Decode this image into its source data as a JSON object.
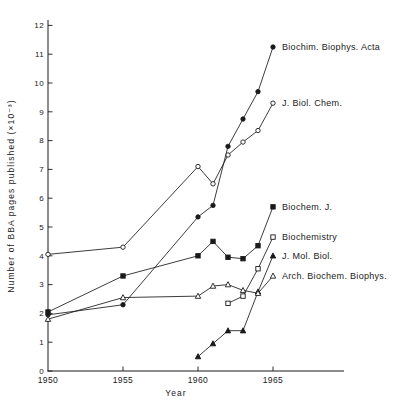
{
  "figure": {
    "title": "",
    "xlabel": "Year",
    "ylabel": "Number of BBA pages published (×10⁻³)"
  },
  "colors": {
    "ink": "#1a1a1a",
    "background": "#ffffff"
  },
  "chart_data": {
    "type": "line",
    "title": "",
    "xlabel": "Year",
    "ylabel": "Number of BBA pages published (×10⁻³)",
    "xlim": [
      1950,
      1969.7
    ],
    "ylim": [
      0,
      12.2
    ],
    "xticks": [
      1950,
      1955,
      1960,
      1965
    ],
    "yticks": [
      0,
      1,
      2,
      3,
      4,
      5,
      6,
      7,
      8,
      9,
      10,
      11,
      12
    ],
    "grid": false,
    "legend_position": "inline-labels-at-line-end",
    "series": [
      {
        "id": "biochim-biophys-acta",
        "name": "Biochim. Biophys. Acta",
        "marker": "filled-circle",
        "x": [
          1950,
          1955,
          1960,
          1961,
          1962,
          1963,
          1964,
          1965
        ],
        "y": [
          1.95,
          2.3,
          5.35,
          5.75,
          7.8,
          8.75,
          9.7,
          11.25
        ]
      },
      {
        "id": "j-biol-chem",
        "name": "J. Biol. Chem.",
        "marker": "open-circle",
        "x": [
          1950,
          1955,
          1960,
          1961,
          1962,
          1963,
          1964,
          1965
        ],
        "y": [
          4.05,
          4.3,
          7.1,
          6.5,
          7.5,
          7.95,
          8.35,
          9.3
        ]
      },
      {
        "id": "biochem-j",
        "name": "Biochem. J.",
        "marker": "filled-square",
        "x": [
          1950,
          1955,
          1960,
          1961,
          1962,
          1963,
          1964,
          1965
        ],
        "y": [
          2.05,
          3.3,
          4.0,
          4.5,
          3.95,
          3.9,
          4.35,
          5.7
        ]
      },
      {
        "id": "biochemistry",
        "name": "Biochemistry",
        "marker": "open-square",
        "x": [
          1962,
          1963,
          1964,
          1965
        ],
        "y": [
          2.35,
          2.6,
          3.55,
          4.65
        ]
      },
      {
        "id": "j-mol-biol",
        "name": "J. Mol. Biol.",
        "marker": "filled-triangle",
        "x": [
          1960,
          1961,
          1962,
          1963,
          1964,
          1965
        ],
        "y": [
          0.5,
          0.95,
          1.4,
          1.4,
          2.75,
          4.0
        ]
      },
      {
        "id": "arch-biochem-biophys",
        "name": "Arch. Biochem. Biophys.",
        "marker": "open-triangle",
        "x": [
          1950,
          1955,
          1960,
          1961,
          1962,
          1963,
          1964,
          1965
        ],
        "y": [
          1.8,
          2.55,
          2.6,
          2.95,
          3.0,
          2.8,
          2.7,
          3.3
        ]
      }
    ]
  }
}
